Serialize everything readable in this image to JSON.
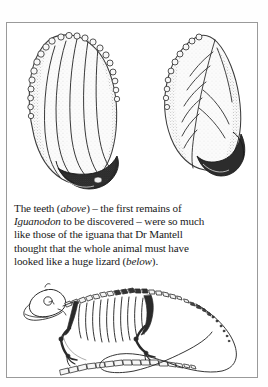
{
  "page": {
    "background_color": "#fefefe",
    "border_color": "#9a9a9a",
    "ink_color": "#1a1a1a"
  },
  "figures": {
    "top": {
      "name": "iguanodon-teeth-illustration",
      "description": "Two fossil Iguanodon teeth drawn in stipple engraving style",
      "items": [
        {
          "name": "tooth-left",
          "description": "Large leaf-shaped crown with denticulate (serrated) margins, longitudinal ridges and a dark worn root base"
        },
        {
          "name": "tooth-right",
          "description": "Smaller tilted tooth with serrated upper-left margin, central ridge and branching veins"
        }
      ]
    },
    "bottom": {
      "name": "iguana-skeleton-illustration",
      "description": "Lateral view line drawing of an iguana skeleton with skull, ribcage, limbs and a long curling tail"
    }
  },
  "caption": {
    "lines": [
      {
        "segments": [
          {
            "text": "The teeth (",
            "italic": false
          },
          {
            "text": "above",
            "italic": true
          },
          {
            "text": ") – the first remains of",
            "italic": false
          }
        ]
      },
      {
        "segments": [
          {
            "text": "Iguanodon",
            "italic": true
          },
          {
            "text": " to be discovered – were so much",
            "italic": false
          }
        ]
      },
      {
        "segments": [
          {
            "text": "like those of the iguana that Dr Mantell",
            "italic": false
          }
        ]
      },
      {
        "segments": [
          {
            "text": "thought that the whole animal must have",
            "italic": false
          }
        ]
      },
      {
        "segments": [
          {
            "text": "looked like a huge lizard (",
            "italic": false
          },
          {
            "text": "below",
            "italic": true
          },
          {
            "text": ").",
            "italic": false
          }
        ]
      }
    ]
  }
}
